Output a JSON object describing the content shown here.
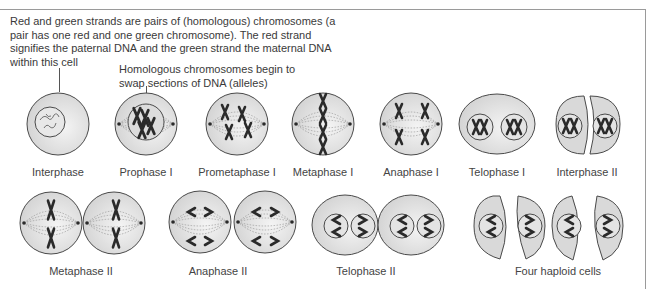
{
  "annotations": {
    "homologous_note": "Red and green strands are pairs of (homologous) chromosomes (a pair has one red and one green chromosome). The red strand signifies the paternal DNA and the green strand the maternal DNA within this cell",
    "crossover_note": "Homologous chromosomes begin to swap sections of DNA (alleles)"
  },
  "stages_row1": [
    {
      "label": "Interphase",
      "cx": 58
    },
    {
      "label": "Prophase I",
      "cx": 146
    },
    {
      "label": "Prometaphase I",
      "cx": 237
    },
    {
      "label": "Metaphase I",
      "cx": 323
    },
    {
      "label": "Anaphase I",
      "cx": 411
    },
    {
      "label": "Telophase I",
      "cx": 497
    },
    {
      "label": "Interphase II",
      "cx": 587
    }
  ],
  "stages_row2": [
    {
      "label": "Metaphase II",
      "cx": 81
    },
    {
      "label": "Anaphase II",
      "cx": 218
    },
    {
      "label": "Telophase II",
      "cx": 366
    },
    {
      "label": "Four haploid cells",
      "cx": 558
    }
  ],
  "colors": {
    "cell_fill": "#d9d9d9",
    "cell_stroke": "#4a4a4a",
    "chromosome": "#2a2a2a",
    "spindle": "#8a8a8a",
    "frame": "#9a9a9a"
  }
}
